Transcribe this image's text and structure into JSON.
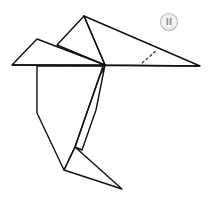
{
  "diagram": {
    "step_badge": {
      "label": "II"
    },
    "colors": {
      "paper_main": "#a9a9a9",
      "paper_dark": "#7d7d7d",
      "paper_shadow": "#8e8e8e",
      "outline": "#111111",
      "background": "#ffffff"
    },
    "annotations": [
      {
        "type": "dashed-fold-line",
        "location": "right wing / beak"
      }
    ]
  }
}
